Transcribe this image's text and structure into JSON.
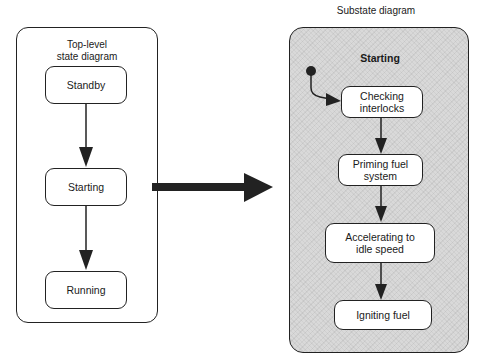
{
  "top_level": {
    "title_line1": "Top-level",
    "title_line2": "state diagram",
    "states": [
      {
        "label": "Standby"
      },
      {
        "label": "Starting"
      },
      {
        "label": "Running"
      }
    ]
  },
  "substate": {
    "caption": "Substate diagram",
    "composite_label": "Starting",
    "states": [
      {
        "line1": "Checking",
        "line2": "interlocks"
      },
      {
        "line1": "Priming fuel",
        "line2": "system"
      },
      {
        "line1": "Accelerating to",
        "line2": "idle speed"
      },
      {
        "line1": "Igniting fuel",
        "line2": ""
      }
    ]
  },
  "colors": {
    "stroke": "#222222",
    "substate_fill": "#d9d9d9",
    "state_fill": "#ffffff"
  }
}
